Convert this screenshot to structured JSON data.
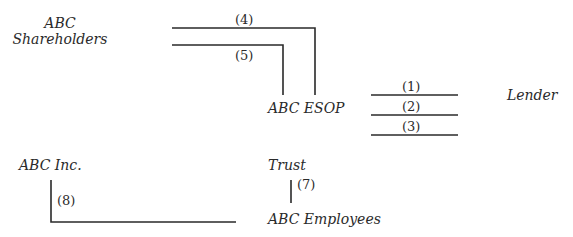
{
  "nodes": {
    "shareholders": {
      "line1": "ABC",
      "line2": "Shareholders"
    },
    "esop": "ABC ESOP",
    "lender": "Lender",
    "inc": "ABC Inc.",
    "trust": "Trust",
    "employees": "ABC Employees"
  },
  "steps": {
    "s1": "(1)",
    "s2": "(2)",
    "s3": "(3)",
    "s4": "(4)",
    "s5": "(5)",
    "s7": "(7)",
    "s8": "(8)"
  },
  "colors": {
    "line": "#2a2a2a",
    "text": "#2a2a2a",
    "background": "#ffffff"
  }
}
